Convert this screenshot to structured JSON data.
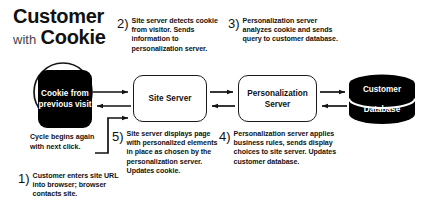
{
  "title": {
    "line1": "Customer",
    "with": "with",
    "line2": "Cookie"
  },
  "nodes": {
    "cookie": "Cookie from previous visit",
    "site_server": "Site Server",
    "personalization_server": "Personalization Server",
    "database_top": "Customer",
    "database_bottom": "Database"
  },
  "cycle_note": "Cycle begins again with next click.",
  "steps": [
    {
      "number": "1)",
      "text": "Customer enters site URL into browser; browser contacts site."
    },
    {
      "number": "2)",
      "text": "Site server detects cookie from visitor. Sends information to personalization server."
    },
    {
      "number": "3)",
      "text": "Personalization server analyzes cookie and sends query to customer database."
    },
    {
      "number": "4)",
      "text": "Personalization server applies business rules, sends display choices to site server. Updates customer database."
    },
    {
      "number": "5)",
      "text": "Site server displays page with personalized elements in place as chosen by the personalization server. Updates cookie."
    }
  ],
  "colors": {
    "background": "#ffffff",
    "ink": "#111111",
    "node_fill_dark": "#000000",
    "node_fill_light": "#ffffff",
    "stroke": "#1a1a1a"
  }
}
